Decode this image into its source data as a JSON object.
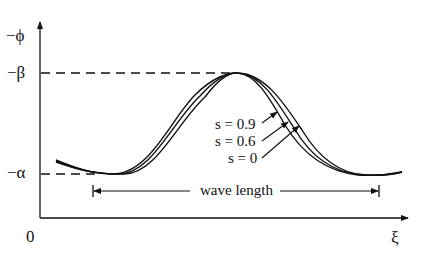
{
  "figure": {
    "y_axis_label": "−ϕ",
    "x_axis_label": "ξ",
    "origin_label": "0",
    "level_top_label": "−β",
    "level_bottom_label": "−α",
    "wavelength_label": "wave length",
    "curves": [
      {
        "label": "s = 0.9"
      },
      {
        "label": "s = 0.6"
      },
      {
        "label": "s = 0"
      }
    ],
    "line_color": "#111111",
    "background": "#ffffff"
  }
}
